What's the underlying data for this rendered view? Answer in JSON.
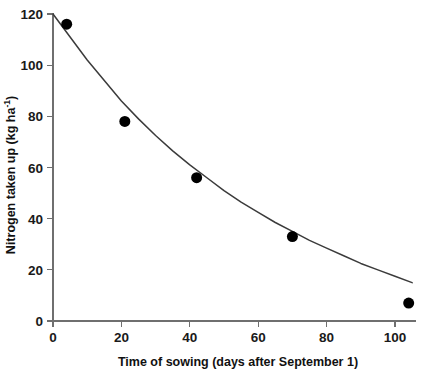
{
  "chart_data": {
    "type": "scatter",
    "title": "",
    "subtitle": "",
    "xlabel": "Time of sowing (days after September 1)",
    "ylabel": "Nitrogen taken up (kg ha",
    "ylabel_superscript": "-1",
    "ylabel_suffix": ")",
    "ylabel_full": "Nitrogen taken up (kg ha-1)",
    "xlim": [
      0,
      110
    ],
    "ylim": [
      0,
      122
    ],
    "xticks": [
      0,
      20,
      40,
      60,
      80,
      100
    ],
    "yticks": [
      0,
      20,
      40,
      60,
      80,
      100,
      120
    ],
    "xtick_labels": [
      "0",
      "20",
      "40",
      "60",
      "80",
      "100"
    ],
    "ytick_labels": [
      "0",
      "20",
      "40",
      "60",
      "80",
      "100",
      "120"
    ],
    "grid": false,
    "legend": false,
    "legend_position": "none",
    "marker": "filled-circle",
    "marker_color": "#000000",
    "marker_size_px": 11,
    "curve_color": "#3b3b3b",
    "axis_color": "#6f6f6f",
    "background_color": "#ffffff",
    "points": [
      {
        "x": 4,
        "y": 116
      },
      {
        "x": 21,
        "y": 78
      },
      {
        "x": 42,
        "y": 56
      },
      {
        "x": 70,
        "y": 33
      },
      {
        "x": 104,
        "y": 7
      }
    ],
    "series": [
      {
        "name": "Nitrogen taken up",
        "x": [
          4,
          21,
          42,
          70,
          104
        ],
        "values": [
          116,
          78,
          56,
          33,
          7
        ]
      }
    ],
    "fitted_curve": {
      "name": "fitted decay curve",
      "x": [
        0,
        5,
        10,
        15,
        20,
        25,
        30,
        35,
        40,
        45,
        50,
        55,
        60,
        65,
        70,
        75,
        80,
        85,
        90,
        95,
        100,
        105
      ],
      "values": [
        120,
        111,
        102,
        94,
        86,
        79,
        72.5,
        66.5,
        61,
        56,
        51,
        46.5,
        42.5,
        38.5,
        35,
        31.5,
        28.5,
        25.5,
        22.5,
        20,
        17.5,
        15
      ]
    }
  },
  "figure": {
    "x_axis_title": "Time of sowing (days after September 1)",
    "y_axis_title_main": "Nitrogen taken up (kg ha",
    "y_axis_title_sup": "-1",
    "y_axis_title_end": ")"
  }
}
